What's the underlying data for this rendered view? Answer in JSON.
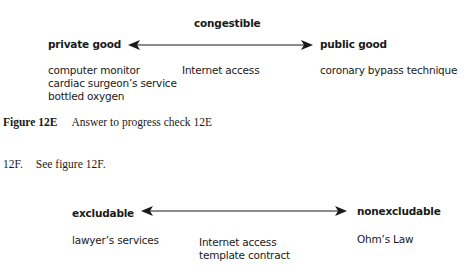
{
  "figure_12e": {
    "top_label": "congestible",
    "left_label": "private good",
    "right_label": "public good",
    "left_items": [
      "computer monitor",
      "cardiac surgeon’s service",
      "bottled oxygen"
    ],
    "middle_items": [
      "Internet access"
    ],
    "right_items": [
      "coronary bypass technique"
    ],
    "caption_label": "Figure 12E",
    "caption_text": "Answer to progress check 12E"
  },
  "body_text": {
    "number": "12F.",
    "text": "See figure 12F."
  },
  "figure_12f": {
    "left_label": "excludable",
    "right_label": "nonexcludable",
    "left_items": [
      "lawyer’s services"
    ],
    "middle_items": [
      "Internet access",
      "template contract"
    ],
    "right_items": [
      "Ohm’s Law"
    ]
  }
}
